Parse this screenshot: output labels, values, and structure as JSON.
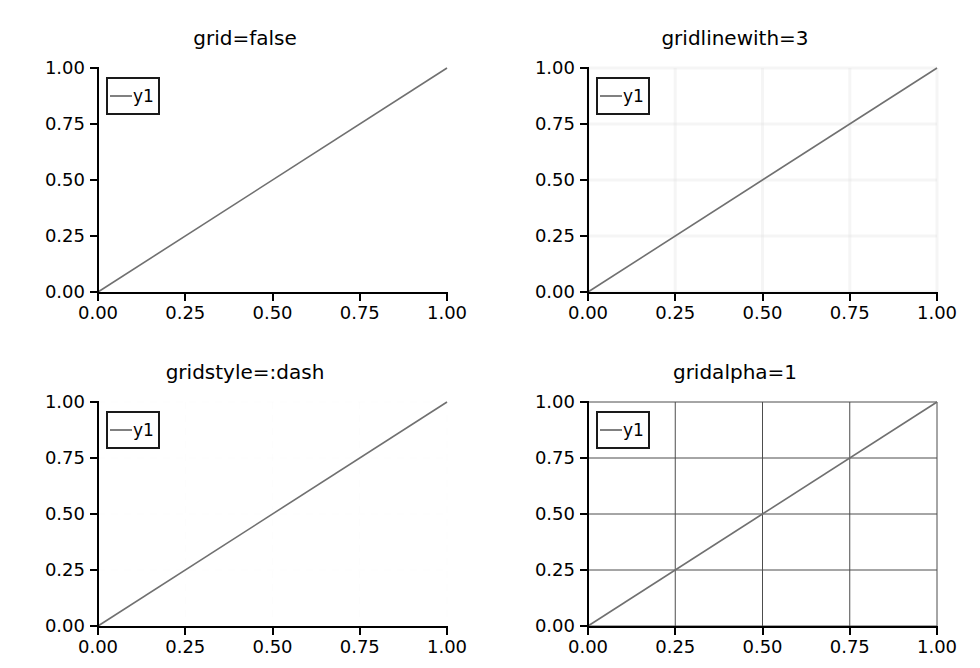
{
  "figure": {
    "width": 980,
    "height": 668,
    "background": "#ffffff",
    "rows": 2,
    "cols": 2
  },
  "style": {
    "line_color": "#707070",
    "spine_color": "#000000",
    "text_color": "#000000",
    "legend_border_color": "#1a1a1a",
    "legend_background": "#ffffff"
  },
  "chart_data": [
    {
      "type": "line",
      "title": "grid=false",
      "xlabel": "",
      "ylabel": "",
      "xlim": [
        0,
        1
      ],
      "ylim": [
        0,
        1
      ],
      "xticks": [
        "0.00",
        "0.25",
        "0.50",
        "0.75",
        "1.00"
      ],
      "yticks": [
        "0.00",
        "0.25",
        "0.50",
        "0.75",
        "1.00"
      ],
      "xtick_values": [
        0,
        0.25,
        0.5,
        0.75,
        1
      ],
      "ytick_values": [
        0,
        0.25,
        0.5,
        0.75,
        1
      ],
      "grid": false,
      "grid_color": "#e6e6e6",
      "grid_linewidth": 0,
      "grid_style": "solid",
      "grid_alpha": 0,
      "legend": {
        "position": "top-left",
        "entries": [
          {
            "label": "y1",
            "color": "#808080"
          }
        ]
      },
      "series": [
        {
          "name": "y1",
          "color": "#707070",
          "x": [
            0,
            1
          ],
          "values": [
            0,
            1
          ]
        }
      ]
    },
    {
      "type": "line",
      "title": "gridlinewith=3",
      "xlabel": "",
      "ylabel": "",
      "xlim": [
        0,
        1
      ],
      "ylim": [
        0,
        1
      ],
      "xticks": [
        "0.00",
        "0.25",
        "0.50",
        "0.75",
        "1.00"
      ],
      "yticks": [
        "0.00",
        "0.25",
        "0.50",
        "0.75",
        "1.00"
      ],
      "xtick_values": [
        0,
        0.25,
        0.5,
        0.75,
        1
      ],
      "ytick_values": [
        0,
        0.25,
        0.5,
        0.75,
        1
      ],
      "grid": true,
      "grid_color": "#e2e2e2",
      "grid_linewidth": 3,
      "grid_style": "solid",
      "grid_alpha": 0.35,
      "legend": {
        "position": "top-left",
        "entries": [
          {
            "label": "y1",
            "color": "#808080"
          }
        ]
      },
      "series": [
        {
          "name": "y1",
          "color": "#707070",
          "x": [
            0,
            1
          ],
          "values": [
            0,
            1
          ]
        }
      ]
    },
    {
      "type": "line",
      "title": "gridstyle=:dash",
      "xlabel": "",
      "ylabel": "",
      "xlim": [
        0,
        1
      ],
      "ylim": [
        0,
        1
      ],
      "xticks": [
        "0.00",
        "0.25",
        "0.50",
        "0.75",
        "1.00"
      ],
      "yticks": [
        "0.00",
        "0.25",
        "0.50",
        "0.75",
        "1.00"
      ],
      "xtick_values": [
        0,
        0.25,
        0.5,
        0.75,
        1
      ],
      "ytick_values": [
        0,
        0.25,
        0.5,
        0.75,
        1
      ],
      "grid": true,
      "grid_color": "#efefef",
      "grid_linewidth": 1,
      "grid_style": "dash",
      "grid_alpha": 0.12,
      "legend": {
        "position": "top-left",
        "entries": [
          {
            "label": "y1",
            "color": "#808080"
          }
        ]
      },
      "series": [
        {
          "name": "y1",
          "color": "#707070",
          "x": [
            0,
            1
          ],
          "values": [
            0,
            1
          ]
        }
      ]
    },
    {
      "type": "line",
      "title": "gridalpha=1",
      "xlabel": "",
      "ylabel": "",
      "xlim": [
        0,
        1
      ],
      "ylim": [
        0,
        1
      ],
      "xticks": [
        "0.00",
        "0.25",
        "0.50",
        "0.75",
        "1.00"
      ],
      "yticks": [
        "0.00",
        "0.25",
        "0.50",
        "0.75",
        "1.00"
      ],
      "xtick_values": [
        0,
        0.25,
        0.5,
        0.75,
        1
      ],
      "ytick_values": [
        0,
        0.25,
        0.5,
        0.75,
        1
      ],
      "grid": true,
      "grid_color": "#4d4d4d",
      "grid_linewidth": 1,
      "grid_style": "solid",
      "grid_alpha": 1,
      "legend": {
        "position": "top-left",
        "entries": [
          {
            "label": "y1",
            "color": "#808080"
          }
        ]
      },
      "series": [
        {
          "name": "y1",
          "color": "#707070",
          "x": [
            0,
            1
          ],
          "values": [
            0,
            1
          ]
        }
      ]
    }
  ]
}
